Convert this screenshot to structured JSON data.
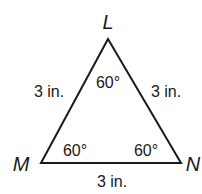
{
  "figure": {
    "type": "equilateral triangle",
    "stroke_color": "#1a1a1a",
    "vertices": {
      "L": {
        "label": "L"
      },
      "M": {
        "label": "M"
      },
      "N": {
        "label": "N"
      }
    },
    "sides": {
      "LM": "3 in.",
      "LN": "3 in.",
      "MN": "3 in."
    },
    "angles": {
      "L": "60°",
      "M": "60°",
      "N": "60°"
    }
  }
}
